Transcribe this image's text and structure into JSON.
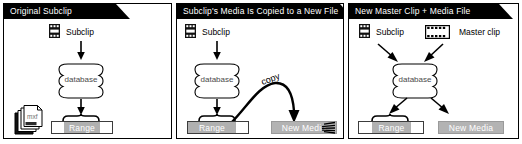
{
  "figure": {
    "title_area": "Avid subclip media relationship diagram",
    "panels": [
      {
        "id": "panel-1",
        "title": "Original Subclip",
        "nodes": {
          "subclip_label": "Subclip",
          "database_label": "database",
          "range_label": "Range",
          "mxf_label": "mxf"
        },
        "icons": [
          "subclip-icon",
          "database-cylinder-icon",
          "mxf-file-stack-icon"
        ]
      },
      {
        "id": "panel-2",
        "title": "Subclip's Media Is Copied to a New File",
        "nodes": {
          "subclip_label": "Subclip",
          "database_label": "database",
          "range_label": "Range",
          "copy_label": "copy",
          "new_media_label": "New Media"
        },
        "icons": [
          "subclip-icon",
          "database-cylinder-icon",
          "copy-arrow-icon",
          "media-lines-icon"
        ]
      },
      {
        "id": "panel-3",
        "title": "New Master Clip + Media File",
        "nodes": {
          "subclip_label": "Subclip",
          "master_clip_label": "Master clip",
          "database_label": "database",
          "range_label": "Range",
          "new_media_label": "New Media"
        },
        "icons": [
          "subclip-icon",
          "master-clip-filmstrip-icon",
          "database-cylinder-icon"
        ]
      }
    ],
    "colors": {
      "banner_background": "#000000",
      "banner_text": "#ffffff",
      "range_segment": "#b0b0b0",
      "new_media_box": "#b3b3b3",
      "database_text": "#4a4a4a",
      "panel_border": "#000000",
      "page_background": "#ffffff"
    }
  }
}
